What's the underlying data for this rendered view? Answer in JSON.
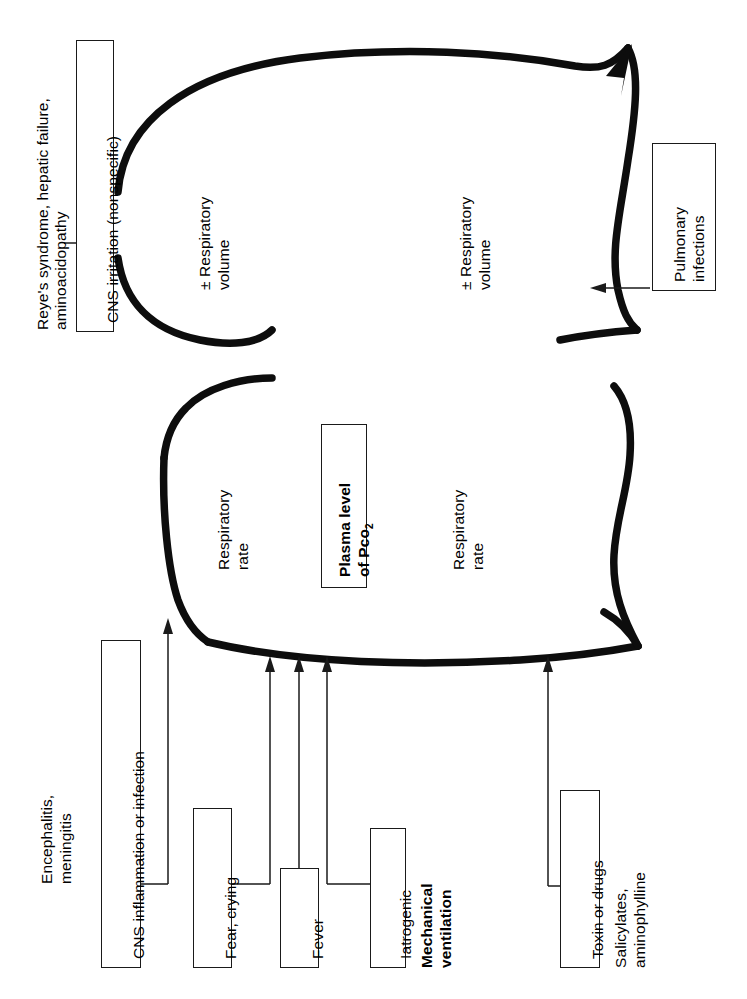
{
  "figure": {
    "type": "physiology-feedback-diagram",
    "central_node": {
      "line1": "Plasma level",
      "line2": "of Pco",
      "subscript": "2"
    },
    "loops": [
      {
        "name": "upper-loop",
        "left_label_line1": "± Respiratory",
        "left_label_line2": "volume",
        "right_label_line1": "± Respiratory",
        "right_label_line2": "volume"
      },
      {
        "name": "lower-loop",
        "left_label_line1": "Respiratory",
        "left_label_line2": "rate",
        "right_label_line1": "Respiratory",
        "right_label_line2": "rate"
      }
    ],
    "boxes": {
      "cns_irritation": "CNS irritation (nonspecific)",
      "cns_irritation_note_line1": "Reye's syndrome, hepatic failure,",
      "cns_irritation_note_line2": "aminoacidopathy",
      "pulmonary_infections_line1": "Pulmonary",
      "pulmonary_infections_line2": "infections",
      "cns_inflammation": "CNS inflammation or infection",
      "cns_inflammation_note_line1": "Encephalitis,",
      "cns_inflammation_note_line2": "meningitis",
      "fear_crying": "Fear, crying",
      "fever": "Fever",
      "iatrogenic": "Iatrogenic",
      "iatrogenic_note_line1": "Mechanical",
      "iatrogenic_note_line2": "ventilation",
      "toxin_or_drugs": "Toxin or drugs",
      "toxin_note_line1": "Salicylates,",
      "toxin_note_line2": "aminophylline"
    },
    "colors": {
      "ink": "#0d0d0d",
      "background": "#ffffff",
      "box_border": "#1a1a1a"
    }
  }
}
